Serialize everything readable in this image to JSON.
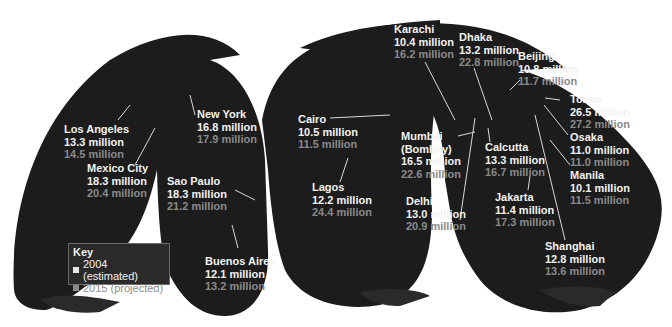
{
  "key": {
    "title": "Key",
    "items": [
      {
        "label": "2004 (estimated)",
        "color": "#e6e6e6"
      },
      {
        "label": "2015 (projected)",
        "color": "#8a8a8a"
      }
    ]
  },
  "colors": {
    "ocean_background": "#ffffff",
    "land_map": "#1c1c1c",
    "label_2004": "#f2f2f2",
    "label_2015": "#8a8a8a"
  },
  "cities": [
    {
      "name": "Los Angeles",
      "pop_2004": "13.3 million",
      "pop_2015": "14.5 million"
    },
    {
      "name": "New York",
      "pop_2004": "16.8 million",
      "pop_2015": "17.9 million"
    },
    {
      "name": "Mexico City",
      "pop_2004": "18.3 million",
      "pop_2015": "20.4 million"
    },
    {
      "name": "Sao Paulo",
      "pop_2004": "18.3 million",
      "pop_2015": "21.2 million"
    },
    {
      "name": "Buenos Aires",
      "pop_2004": "12.1 million",
      "pop_2015": "13.2 million"
    },
    {
      "name": "Cairo",
      "pop_2004": "10.5 million",
      "pop_2015": "11.5 million"
    },
    {
      "name": "Lagos",
      "pop_2004": "12.2 million",
      "pop_2015": "24.4 million"
    },
    {
      "name": "Karachi",
      "pop_2004": "10.4 million",
      "pop_2015": "16.2 million"
    },
    {
      "name": "Mumbai (Bombay)",
      "name_line1": "Mumbai",
      "name_line2": "(Bombay)",
      "pop_2004": "16.5 million",
      "pop_2015": "22.6 million"
    },
    {
      "name": "Delhi",
      "pop_2004": "13.0 million",
      "pop_2015": "20.9 million"
    },
    {
      "name": "Dhaka",
      "pop_2004": "13.2 million",
      "pop_2015": "22.8 million"
    },
    {
      "name": "Calcutta",
      "pop_2004": "13.3 million",
      "pop_2015": "16.7 million"
    },
    {
      "name": "Beijing",
      "pop_2004": "10.8 million",
      "pop_2015": "11.7 million"
    },
    {
      "name": "Tokyo",
      "pop_2004": "26.5 million",
      "pop_2015": "27.2 million"
    },
    {
      "name": "Osaka",
      "pop_2004": "11.0 million",
      "pop_2015": "11.0 million"
    },
    {
      "name": "Manila",
      "pop_2004": "10.1 million",
      "pop_2015": "11.5 million"
    },
    {
      "name": "Jakarta",
      "pop_2004": "11.4 million",
      "pop_2015": "17.3 million"
    },
    {
      "name": "Shanghai",
      "pop_2004": "12.8 million",
      "pop_2015": "13.6 million"
    }
  ]
}
